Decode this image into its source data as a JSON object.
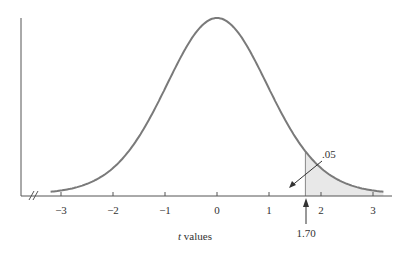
{
  "chart_data": {
    "type": "line",
    "title": "",
    "xlabel": "t values",
    "xlabel_italic_part": "t",
    "xlabel_rest": " values",
    "ylabel": "",
    "xlim": [
      -3.3,
      3.3
    ],
    "x_ticks": [
      -3,
      -2,
      -1,
      0,
      1,
      2,
      3
    ],
    "x_tick_labels": [
      "−3",
      "−2",
      "−1",
      "0",
      "1",
      "2",
      "3"
    ],
    "series": [
      {
        "name": "t distribution density",
        "distribution": "t",
        "x_range": [
          -3.2,
          3.2
        ]
      }
    ],
    "shaded_region": {
      "from": 1.7,
      "to": 3.2,
      "area": 0.05
    },
    "annotations": [
      {
        "text": ".05",
        "points_to": "shaded upper tail area"
      },
      {
        "text": "1.70",
        "points_to": "critical t value",
        "x": 1.7
      }
    ],
    "axis_break": true,
    "grid": false,
    "legend": null
  },
  "colors": {
    "curve": "#7a7a7a",
    "axis": "#555555",
    "shade": "#e6e6e6"
  }
}
